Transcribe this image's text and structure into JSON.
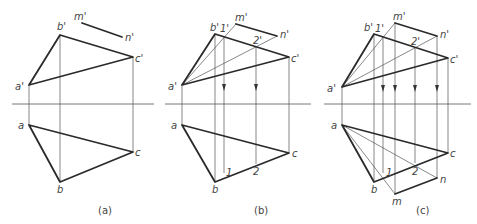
{
  "figure": {
    "panels": [
      {
        "caption": "(a)",
        "labels": {
          "a_prime": "a'",
          "b_prime": "b'",
          "c_prime": "c'",
          "m_prime": "m'",
          "n_prime": "n'",
          "a": "a",
          "b": "b",
          "c": "c"
        }
      },
      {
        "caption": "(b)",
        "labels": {
          "a_prime": "a'",
          "b_prime": "b'",
          "c_prime": "c'",
          "m_prime": "m'",
          "n_prime": "n'",
          "one_prime": "1'",
          "two_prime": "2'",
          "a": "a",
          "b": "b",
          "c": "c",
          "one": "1",
          "two": "2"
        }
      },
      {
        "caption": "(c)",
        "labels": {
          "a_prime": "a'",
          "b_prime": "b'",
          "c_prime": "c'",
          "m_prime": "m'",
          "n_prime": "n'",
          "one_prime": "1'",
          "two_prime": "2'",
          "a": "a",
          "b": "b",
          "c": "c",
          "m": "m",
          "n": "n",
          "one": "1",
          "two": "2"
        }
      }
    ]
  }
}
